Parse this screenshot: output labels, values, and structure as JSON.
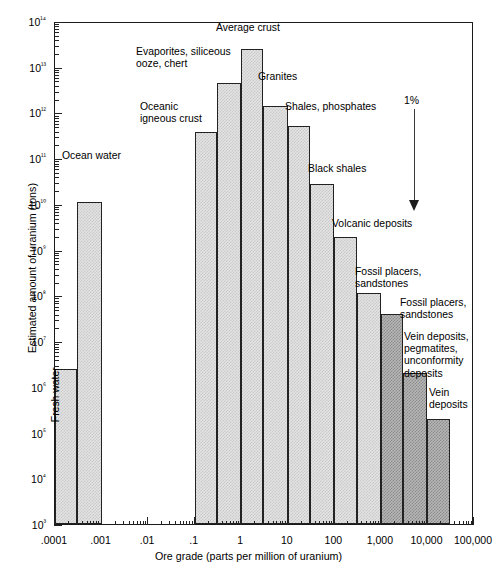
{
  "chart_data": {
    "type": "bar",
    "title": "",
    "xlabel": "Ore grade (parts per million of uranium)",
    "ylabel": "Estimated amount of uranium (tons)",
    "xscale": "log",
    "yscale": "log",
    "xlim": [
      0.0001,
      100000
    ],
    "ylim": [
      1000,
      100000000000000
    ],
    "grid": false,
    "legend": "none",
    "x_tick_labels": [
      ".0001",
      ".001",
      ".01",
      ".1",
      "1",
      "10",
      "100",
      "1,000",
      "10,000",
      "100,000"
    ],
    "x_tick_values": [
      0.0001,
      0.001,
      0.01,
      0.1,
      1,
      10,
      100,
      1000,
      10000,
      100000
    ],
    "y_tick_labels": [
      "10³",
      "10⁴",
      "10⁵",
      "10⁶",
      "10⁷",
      "10⁸",
      "10⁹",
      "10¹⁰",
      "10¹¹",
      "10¹²",
      "10¹³",
      "10¹⁴"
    ],
    "y_tick_values": [
      1000,
      10000,
      100000,
      1000000,
      10000000,
      100000000,
      1000000000,
      10000000000,
      100000000000,
      1000000000000,
      10000000000000,
      100000000000000
    ],
    "bars": [
      {
        "label": "Fresh water",
        "x_start": 0.0001,
        "x_end": 0.0003,
        "value": 2500000,
        "shade": "light",
        "label_orientation": "vertical"
      },
      {
        "label": "Ocean water",
        "x_start": 0.0003,
        "x_end": 0.001,
        "value": 11000000000,
        "shade": "light",
        "label_orientation": "horizontal"
      },
      {
        "label": "Oceanic\nigneous crust",
        "x_start": 0.1,
        "x_end": 0.3,
        "value": 380000000000,
        "shade": "light",
        "label_orientation": "horizontal"
      },
      {
        "label": "Evaporites, siliceous\nooze, chert",
        "x_start": 0.3,
        "x_end": 1.0,
        "value": 4500000000000,
        "shade": "light",
        "label_orientation": "horizontal"
      },
      {
        "label": "Average crust",
        "x_start": 1.0,
        "x_end": 3.0,
        "value": 25000000000000,
        "shade": "light",
        "label_orientation": "horizontal"
      },
      {
        "label": "Granites",
        "x_start": 3.0,
        "x_end": 10.0,
        "value": 1400000000000,
        "shade": "light",
        "label_orientation": "horizontal"
      },
      {
        "label": "Shales, phosphates",
        "x_start": 10.0,
        "x_end": 30.0,
        "value": 500000000000,
        "shade": "light",
        "label_orientation": "horizontal"
      },
      {
        "label": "Black shales",
        "x_start": 30.0,
        "x_end": 100.0,
        "value": 27000000000,
        "shade": "light",
        "label_orientation": "horizontal"
      },
      {
        "label": "Volcanic deposits",
        "x_start": 100.0,
        "x_end": 300.0,
        "value": 1900000000,
        "shade": "light",
        "label_orientation": "horizontal"
      },
      {
        "label": "Fossil placers,\nsandstones",
        "x_start": 300.0,
        "x_end": 1000.0,
        "value": 110000000,
        "shade": "light",
        "label_orientation": "horizontal"
      },
      {
        "label": "Fossil placers,\nsandstones",
        "x_start": 1000.0,
        "x_end": 3000.0,
        "value": 40000000,
        "shade": "dark",
        "label_orientation": "horizontal"
      },
      {
        "label": "Vein deposits,\npegmatites,\nunconformity\ndeposits",
        "x_start": 3000.0,
        "x_end": 10000.0,
        "value": 2000000,
        "shade": "dark",
        "label_orientation": "horizontal"
      },
      {
        "label": "Vein\ndeposits",
        "x_start": 10000.0,
        "x_end": 30000.0,
        "value": 200000,
        "shade": "dark",
        "label_orientation": "horizontal"
      }
    ],
    "annotations": [
      {
        "text": "1%",
        "type": "arrow-down",
        "x": 1100,
        "y_top": 100000000000,
        "y_bottom": 3000000000
      }
    ]
  },
  "labels": {
    "fresh_water": "Fresh water",
    "ocean_water": "Ocean water",
    "oceanic_igneous_crust": "Oceanic\nigneous crust",
    "evaporites": "Evaporites, siliceous\nooze, chert",
    "average_crust": "Average crust",
    "granites": "Granites",
    "shales_phosphates": "Shales, phosphates",
    "black_shales": "Black shales",
    "volcanic_deposits": "Volcanic deposits",
    "fossil_placers_1": "Fossil placers,\nsandstones",
    "fossil_placers_2": "Fossil placers,\nsandstones",
    "vein_pegmatites": "Vein deposits,\npegmatites,\nunconformity\ndeposits",
    "vein_deposits": "Vein\ndeposits",
    "one_percent": "1%"
  }
}
